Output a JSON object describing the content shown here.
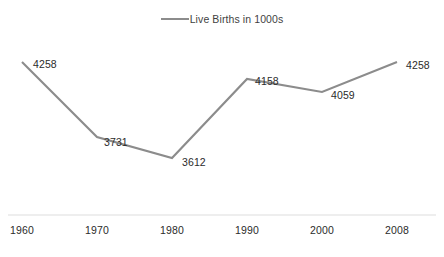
{
  "chart_data": {
    "type": "line",
    "title": "",
    "subtitle": "",
    "xlabel": "",
    "ylabel": "",
    "grid": false,
    "legend_position": "top-center",
    "categories": [
      "1960",
      "1970",
      "1980",
      "1990",
      "2000",
      "2008"
    ],
    "series": [
      {
        "name": "Live Births in 1000s",
        "color": "#8c8c8c",
        "values": [
          4258,
          3731,
          3612,
          4158,
          4059,
          4258
        ],
        "point_labels": [
          "4258",
          "3731",
          "3612",
          "4158",
          "4059",
          "4258"
        ]
      }
    ],
    "ylim": [
      3500,
      4350
    ],
    "axis_line_color": "#e8e8e8"
  },
  "legend": {
    "label": "Live Births in 1000s",
    "swatch_icon": "line-swatch-icon",
    "color": "#8c8c8c"
  },
  "axis": {
    "ticks": [
      {
        "label": "1960",
        "x": 22
      },
      {
        "label": "1970",
        "x": 97
      },
      {
        "label": "1980",
        "x": 172
      },
      {
        "label": "1990",
        "x": 247
      },
      {
        "label": "2000",
        "x": 322
      },
      {
        "label": "2008",
        "x": 397
      }
    ]
  },
  "points": [
    {
      "label": "4258",
      "px": 22,
      "py": 62,
      "lx": 33,
      "ly": 59
    },
    {
      "label": "3731",
      "px": 97,
      "py": 137,
      "lx": 104,
      "ly": 137
    },
    {
      "label": "3612",
      "px": 172,
      "py": 158,
      "lx": 182,
      "ly": 157
    },
    {
      "label": "4158",
      "px": 247,
      "py": 79,
      "lx": 255,
      "ly": 76
    },
    {
      "label": "4059",
      "px": 322,
      "py": 92,
      "lx": 331,
      "ly": 90
    },
    {
      "label": "4258",
      "px": 397,
      "py": 62,
      "lx": 406,
      "ly": 60
    }
  ]
}
